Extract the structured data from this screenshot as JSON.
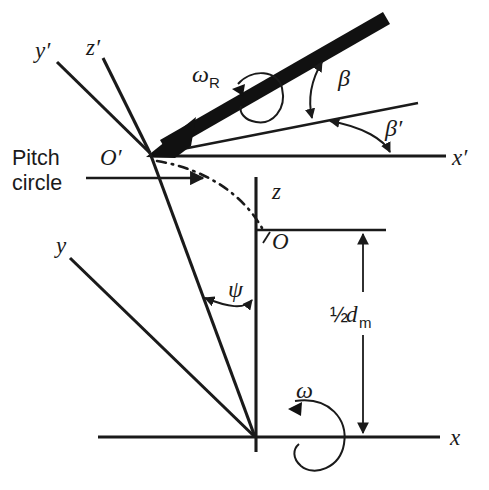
{
  "figure": {
    "type": "technical-line-diagram",
    "background_color": "#ffffff",
    "line_color": "#1a1a1a"
  },
  "labels": {
    "y_prime": "y′",
    "z_prime": "z′",
    "x_prime": "x′",
    "y": "y",
    "z": "z",
    "x": "x",
    "origin_prime": "O′",
    "origin": "O",
    "pitch_line_1": "Pitch",
    "pitch_line_2": "circle",
    "omega_r": "ω",
    "omega_r_sub": "R",
    "omega": "ω",
    "beta": "β",
    "beta_prime": "β′",
    "psi": "ψ",
    "half_dm_frac": "½",
    "half_dm_d": "d",
    "half_dm_sub": "m"
  },
  "annotations": {
    "dimension_label": "½ d_m",
    "angle_beta": "β",
    "angle_beta_prime": "β′",
    "angle_psi": "ψ",
    "rotation_tool": "ω_R",
    "rotation_workpiece": "ω"
  }
}
